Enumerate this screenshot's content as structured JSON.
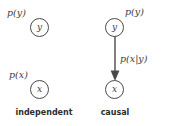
{
  "figure": {
    "background_color": "#ffffff",
    "stroke_color": "#4a4a4a",
    "text_color": "#3d3d3d",
    "caption_color": "#2e2e2e"
  },
  "panels": [
    {
      "id": "independent",
      "caption": "independent",
      "nodes": [
        {
          "id": "y",
          "label": "y",
          "prob": "p(y)"
        },
        {
          "id": "x",
          "label": "x",
          "prob": "p(x)"
        }
      ],
      "edges": []
    },
    {
      "id": "causal",
      "caption": "causal",
      "nodes": [
        {
          "id": "y",
          "label": "y",
          "prob": "p(y)"
        },
        {
          "id": "x",
          "label": "x",
          "prob": "p(x|y)"
        }
      ],
      "edges": [
        {
          "from": "y",
          "to": "x",
          "label": "p(x|y)",
          "arrowhead": "filled-triangle"
        }
      ]
    }
  ],
  "independent": {
    "caption": "independent",
    "node_y_label": "y",
    "node_x_label": "x",
    "prob_y": "p(y)",
    "prob_x": "p(x)"
  },
  "causal": {
    "caption": "causal",
    "node_y_label": "y",
    "node_x_label": "x",
    "prob_y": "p(y)",
    "prob_x_given_y": "p(x|y)"
  }
}
